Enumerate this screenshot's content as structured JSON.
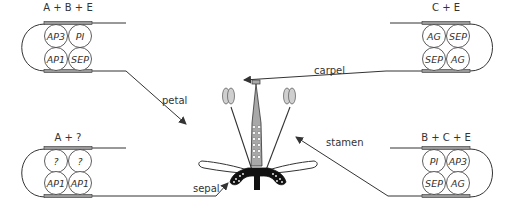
{
  "diagram": {
    "type": "ABCE floral organ identity model",
    "colors": {
      "line": "#333333",
      "bar": "#9a9a9a",
      "circle_fill": "#ffffff",
      "petal_fill": "#ffffff",
      "anther_fill": "#cccccc",
      "carpel_fill": "#aaaaaa",
      "receptacle": "#111111"
    },
    "complexes": [
      {
        "id": "petal",
        "label": "A + B + E",
        "cells": [
          "AP3",
          "PI",
          "AP1",
          "SEP"
        ],
        "organ": "petal",
        "position": "top-left"
      },
      {
        "id": "carpel",
        "label": "C + E",
        "cells": [
          "AG",
          "SEP",
          "SEP",
          "AG"
        ],
        "organ": "carpel",
        "position": "top-right"
      },
      {
        "id": "sepal",
        "label": "A + ?",
        "cells": [
          "?",
          "?",
          "AP1",
          "AP1"
        ],
        "organ": "sepal",
        "position": "bottom-left"
      },
      {
        "id": "stamen",
        "label": "B + C + E",
        "cells": [
          "PI",
          "AP3",
          "SEP",
          "AG"
        ],
        "organ": "stamen",
        "position": "bottom-right"
      }
    ],
    "arrows": {
      "petal": "petal",
      "carpel": "carpel",
      "stamen": "stamen",
      "sepal": "sepal"
    }
  }
}
